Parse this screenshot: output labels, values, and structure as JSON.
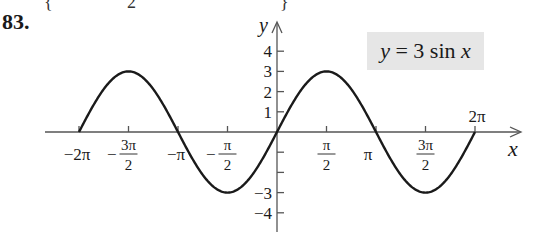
{
  "problem": {
    "number": "83.",
    "top_fragments": [
      "{",
      "2",
      "}"
    ]
  },
  "equation_label": {
    "lhs": "y",
    "eq": " = 3 sin ",
    "var": "x",
    "full": "y = 3 sin x",
    "background": "#e6e6e6"
  },
  "chart_data": {
    "type": "line",
    "title": "y = 3 sin x",
    "xlabel": "x",
    "ylabel": "y",
    "function": "3*sin(x)",
    "xlim": [
      -6.2832,
      6.2832
    ],
    "ylim": [
      -4,
      4
    ],
    "grid": false,
    "legend": "none",
    "x_ticks": [
      -6.2832,
      -4.7124,
      -3.1416,
      -1.5708,
      0,
      1.5708,
      3.1416,
      4.7124,
      6.2832
    ],
    "x_tick_labels": [
      "−2π",
      "−3π/2",
      "−π",
      "−π/2",
      "",
      "π/2",
      "π",
      "3π/2",
      "2π"
    ],
    "y_ticks": [
      -4,
      -3,
      -2,
      -1,
      1,
      2,
      3,
      4
    ],
    "y_tick_labels": [
      "−4",
      "−3",
      "",
      "",
      "1",
      "2",
      "3",
      "4"
    ],
    "series": [
      {
        "name": "y = 3 sin x",
        "x": [
          -6.2832,
          -4.7124,
          -3.1416,
          -1.5708,
          0,
          1.5708,
          3.1416,
          4.7124,
          6.2832
        ],
        "values": [
          0,
          3,
          0,
          -3,
          0,
          3,
          0,
          -3,
          0
        ],
        "color": "#1a1a1a"
      }
    ],
    "key_points": {
      "maxima": [
        [
          -4.7124,
          3
        ],
        [
          1.5708,
          3
        ]
      ],
      "minima": [
        [
          -1.5708,
          -3
        ],
        [
          4.7124,
          -3
        ]
      ],
      "zeros": [
        -6.2832,
        -3.1416,
        0,
        3.1416,
        6.2832
      ]
    }
  }
}
